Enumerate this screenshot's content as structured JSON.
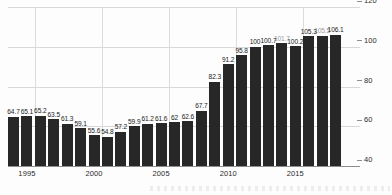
{
  "chart_data": {
    "type": "bar",
    "title": "",
    "subtitle": "",
    "xlabel": "",
    "ylabel": "",
    "ylim": [
      40,
      120
    ],
    "yticks": [
      40,
      60,
      80,
      100,
      120
    ],
    "grid": "horizontal-and-vertical",
    "legend": "none",
    "bar_color": "#272727",
    "categories": [
      "1994",
      "1995",
      "1996",
      "1997",
      "1998",
      "1999",
      "2000",
      "2001",
      "2002",
      "2003",
      "2004",
      "2005",
      "2006",
      "2007",
      "2008",
      "2009",
      "2010",
      "2011",
      "2012",
      "2013",
      "2014",
      "2015",
      "2016",
      "2017",
      "2018"
    ],
    "values": [
      64.7,
      65.1,
      65.2,
      63.5,
      61.3,
      59.1,
      55.6,
      54.8,
      57.2,
      59.9,
      61.2,
      61.6,
      62,
      62.6,
      67.7,
      82.3,
      91.2,
      95.8,
      100,
      100.7,
      101.7,
      100.2,
      105.3,
      105.5,
      106.1
    ],
    "value_labels": [
      "64.7",
      "65.1",
      "65.2",
      "63.5",
      "61.3",
      "59.1",
      "55.6",
      "54.8",
      "57.2",
      "59.9",
      "61.2",
      "61.6",
      "62",
      "62.6",
      "67.7",
      "82.3",
      "91.2",
      "95.8",
      "100",
      "100.7",
      "101.7",
      "100.2",
      "105.3",
      "105.5",
      "106.1"
    ],
    "obscured_label_indices": [
      20,
      23
    ],
    "xtick_labels": [
      "1995",
      "2000",
      "2005",
      "2010",
      "2015"
    ],
    "xtick_categories": [
      "1995",
      "2000",
      "2005",
      "2010",
      "2015"
    ]
  }
}
